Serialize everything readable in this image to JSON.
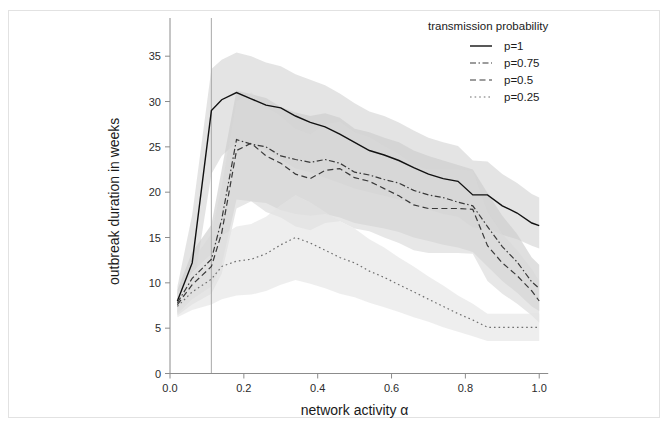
{
  "figure": {
    "background_color": "#ffffff",
    "frame_color": "#e2e2e2"
  },
  "chart_data": {
    "type": "line",
    "title": "",
    "xlabel": "network activity α",
    "ylabel": "outbreak duration in weeks",
    "xlim": [
      0.0,
      1.04
    ],
    "ylim": [
      0,
      38
    ],
    "xticks": [
      "0.0",
      "0.2",
      "0.4",
      "0.6",
      "0.8",
      "1.0"
    ],
    "xtick_values": [
      0.0,
      0.2,
      0.4,
      0.6,
      0.8,
      1.0
    ],
    "yticks": [
      "0",
      "5",
      "10",
      "15",
      "20",
      "25",
      "30",
      "35"
    ],
    "ytick_values": [
      0,
      5,
      10,
      15,
      20,
      25,
      30,
      35
    ],
    "grid": false,
    "legend": {
      "title": "transmission probability",
      "position": "top-right",
      "entries": [
        {
          "label": "p=1",
          "style": "solid",
          "color": "#111111"
        },
        {
          "label": "p=0.75",
          "style": "dashdot",
          "color": "#3a3a3a"
        },
        {
          "label": "p=0.5",
          "style": "dashed",
          "color": "#3a3a3a"
        },
        {
          "label": "p=0.25",
          "style": "dotted",
          "color": "#6e6e6e"
        }
      ]
    },
    "annotations": [
      {
        "type": "vline",
        "x": 0.112,
        "color": "#a8a8a8",
        "label": "critical network activity"
      }
    ],
    "x": [
      0.02,
      0.06,
      0.112,
      0.14,
      0.18,
      0.22,
      0.26,
      0.3,
      0.34,
      0.38,
      0.42,
      0.46,
      0.5,
      0.54,
      0.58,
      0.62,
      0.66,
      0.7,
      0.74,
      0.78,
      0.82,
      0.86,
      0.9,
      0.94,
      0.98,
      1.0
    ],
    "series": [
      {
        "name": "p=1",
        "style": "solid",
        "color": "#111111",
        "values": [
          8.0,
          12.2,
          29.0,
          30.2,
          31.0,
          30.3,
          29.6,
          29.3,
          28.4,
          27.7,
          27.2,
          26.4,
          25.5,
          24.6,
          24.1,
          23.5,
          22.7,
          22.0,
          21.5,
          21.2,
          19.7,
          19.7,
          18.5,
          17.7,
          16.6,
          16.3
        ],
        "band_lower": [
          6.8,
          8.6,
          22.0,
          24.0,
          25.5,
          25.4,
          24.6,
          23.6,
          22.6,
          22.2,
          21.6,
          21.0,
          20.4,
          20.0,
          19.6,
          19.2,
          18.6,
          18.1,
          17.6,
          17.3,
          16.1,
          16.0,
          15.3,
          14.8,
          14.1,
          13.8
        ],
        "band_upper": [
          9.6,
          17.5,
          33.6,
          34.6,
          35.4,
          35.0,
          34.3,
          33.9,
          33.0,
          32.4,
          31.8,
          30.9,
          29.8,
          28.9,
          28.4,
          27.7,
          26.8,
          26.0,
          25.5,
          25.1,
          23.5,
          23.4,
          22.0,
          21.0,
          19.8,
          19.4
        ]
      },
      {
        "name": "p=0.75",
        "style": "dashdot",
        "color": "#3a3a3a",
        "values": [
          7.8,
          10.5,
          12.6,
          17.0,
          25.8,
          25.3,
          25.0,
          24.0,
          23.6,
          23.3,
          23.6,
          23.2,
          22.2,
          21.9,
          21.4,
          21.0,
          20.2,
          19.7,
          19.4,
          18.9,
          18.5,
          16.2,
          14.0,
          12.3,
          10.1,
          9.4
        ],
        "band_lower": [
          6.6,
          8.2,
          9.6,
          12.0,
          19.2,
          19.0,
          18.8,
          18.0,
          17.6,
          17.4,
          17.6,
          17.2,
          16.6,
          16.3,
          16.0,
          15.6,
          15.0,
          14.6,
          14.2,
          13.9,
          13.4,
          11.8,
          10.2,
          8.9,
          7.4,
          6.9
        ],
        "band_upper": [
          9.2,
          13.4,
          16.4,
          22.5,
          31.2,
          30.8,
          30.4,
          29.4,
          28.8,
          28.4,
          28.7,
          28.2,
          27.0,
          26.6,
          26.0,
          25.5,
          24.6,
          24.0,
          23.5,
          23.0,
          22.5,
          19.9,
          17.4,
          15.4,
          12.8,
          12.0
        ]
      },
      {
        "name": "p=0.5",
        "style": "dashed",
        "color": "#3a3a3a",
        "values": [
          7.6,
          9.8,
          11.8,
          15.5,
          24.6,
          25.4,
          24.0,
          23.2,
          22.0,
          21.5,
          22.4,
          22.6,
          21.6,
          21.2,
          20.4,
          19.6,
          18.6,
          18.2,
          18.2,
          18.2,
          18.1,
          14.1,
          12.2,
          10.8,
          9.1,
          8.0
        ],
        "band_lower": [
          6.4,
          7.6,
          8.8,
          11.0,
          18.2,
          19.0,
          17.8,
          17.2,
          16.2,
          15.8,
          16.6,
          16.8,
          16.0,
          15.7,
          15.0,
          14.4,
          13.6,
          13.3,
          13.3,
          13.3,
          13.2,
          10.2,
          8.8,
          7.7,
          6.4,
          5.6
        ],
        "band_upper": [
          8.9,
          12.4,
          15.4,
          20.6,
          30.0,
          31.0,
          29.4,
          28.4,
          27.0,
          26.4,
          27.5,
          27.8,
          26.6,
          26.1,
          25.1,
          24.2,
          23.0,
          22.5,
          22.5,
          22.5,
          22.4,
          17.8,
          15.4,
          13.6,
          11.5,
          10.2
        ]
      },
      {
        "name": "p=0.25",
        "style": "dotted",
        "color": "#6e6e6e",
        "values": [
          7.4,
          9.0,
          10.4,
          11.8,
          12.4,
          12.6,
          13.2,
          14.2,
          15.0,
          14.4,
          13.6,
          12.8,
          12.2,
          11.3,
          10.6,
          9.8,
          9.0,
          8.2,
          7.4,
          6.6,
          5.9,
          5.1,
          5.1,
          5.1,
          5.1,
          5.1
        ],
        "band_lower": [
          6.2,
          7.0,
          7.6,
          8.2,
          8.6,
          8.7,
          9.1,
          9.8,
          10.3,
          9.9,
          9.4,
          8.8,
          8.4,
          7.8,
          7.3,
          6.8,
          6.2,
          5.7,
          5.1,
          4.6,
          4.1,
          3.6,
          3.6,
          3.6,
          3.6,
          3.6
        ],
        "band_upper": [
          8.7,
          11.2,
          13.2,
          15.2,
          16.2,
          16.5,
          17.3,
          18.6,
          19.7,
          18.9,
          17.8,
          16.8,
          16.0,
          14.8,
          13.9,
          12.8,
          11.8,
          10.7,
          9.7,
          8.6,
          7.7,
          6.6,
          6.6,
          6.6,
          6.6,
          6.6
        ]
      }
    ]
  }
}
